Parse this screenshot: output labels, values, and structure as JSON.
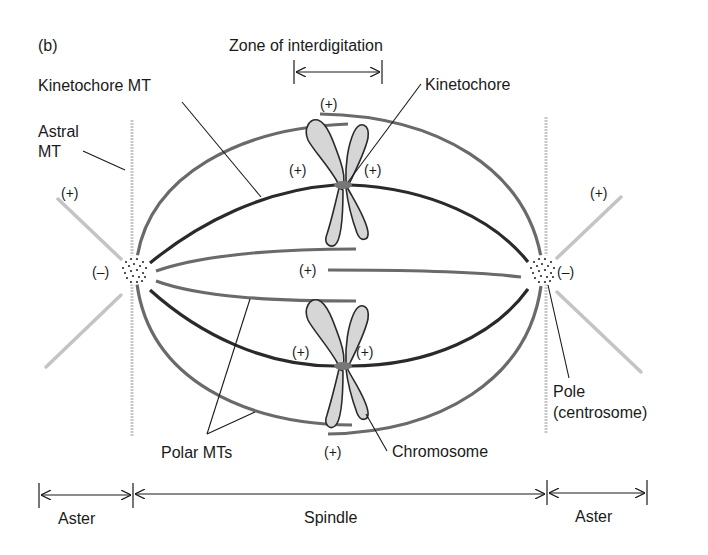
{
  "figure": {
    "panel_label": "(b)",
    "colors": {
      "kinetochore_mt": "#2a2a2a",
      "polar_mt": "#6a6a6a",
      "astral_mt": "#c4c4c4",
      "chromosome_fill": "#d6d6d6",
      "chromosome_stroke": "#2a2a2a",
      "kinetochore": "#777777",
      "leader_line": "#1a1a1a"
    },
    "labels": {
      "zone": "Zone of interdigitation",
      "kinetochore_mt": "Kinetochore MT",
      "kinetochore": "Kinetochore",
      "astral_mt_line1": "Astral",
      "astral_mt_line2": "MT",
      "polar_mts": "Polar MTs",
      "chromosome": "Chromosome",
      "pole_line1": "Pole",
      "pole_line2": "(centrosome)"
    },
    "polarity": {
      "plus": "(+)",
      "minus": "(–)"
    },
    "regions": {
      "left_aster": "Aster",
      "spindle": "Spindle",
      "right_aster": "Aster"
    }
  }
}
